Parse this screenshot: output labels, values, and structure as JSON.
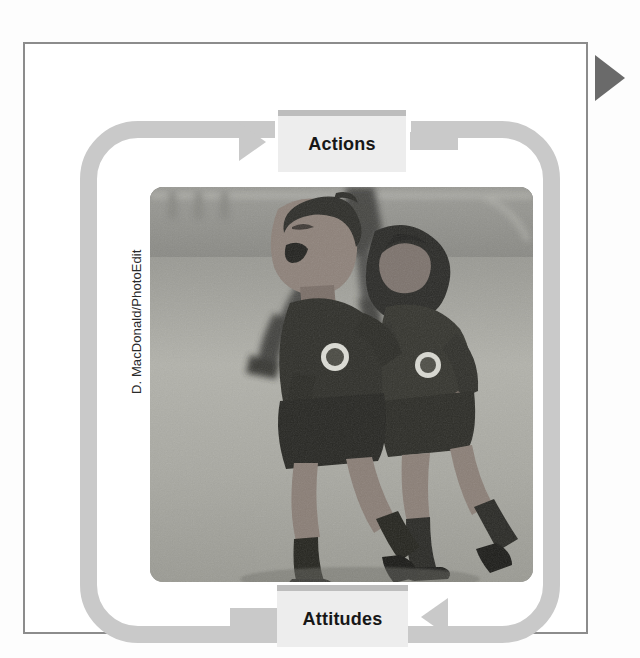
{
  "figure": {
    "type": "cycle-diagram",
    "nodes": [
      {
        "id": "actions",
        "label": "Actions"
      },
      {
        "id": "attitudes",
        "label": "Attitudes"
      }
    ],
    "flow": [
      {
        "from": "attitudes",
        "to": "actions",
        "arrow": "right-arrow-head"
      },
      {
        "from": "actions",
        "to": "attitudes",
        "arrow": "left-arrow-head"
      }
    ],
    "loop": {
      "shape": "rounded-rectangle",
      "band_color": "#c9c9c9",
      "band_width_px": 17
    },
    "frame": {
      "border_color": "#8c8c8c",
      "background": "#ffffff"
    },
    "section_marker": {
      "icon": "triangle-right-icon",
      "color": "#6a6a6a"
    }
  },
  "photo": {
    "credit": "D. MacDonald/PhotoEdit",
    "description": "Two young soccer players in dark jerseys embracing and celebrating on a grass field",
    "tone": "black-and-white",
    "corner_radius_px": 13
  },
  "ghost": {
    "top": "",
    "bottom": ""
  },
  "colors": {
    "node_fill": "#ededed",
    "node_top_rule": "#bdbdbd",
    "loop": "#c9c9c9",
    "frame": "#8c8c8c",
    "marker": "#6a6a6a",
    "text": "#171717"
  }
}
